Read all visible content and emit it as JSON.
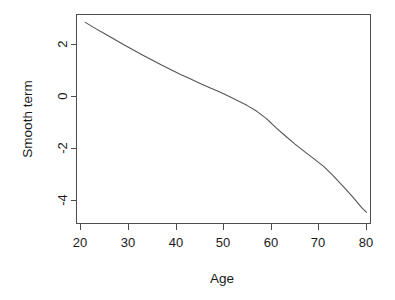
{
  "chart_data": {
    "type": "line",
    "title": "",
    "subtitle": "",
    "xlabel": "Age",
    "ylabel": "Smooth term",
    "xlim": [
      19.0,
      80.9
    ],
    "ylim": [
      -4.95,
      3.13
    ],
    "xticks": [
      20,
      30,
      40,
      50,
      60,
      70,
      80
    ],
    "xtick_labels": [
      "20",
      "30",
      "40",
      "50",
      "60",
      "70",
      "80"
    ],
    "yticks": [
      2,
      0,
      -2,
      -4
    ],
    "ytick_labels": [
      "2",
      "0",
      "-2",
      "-4"
    ],
    "grid": false,
    "legend": false,
    "legend_position": "none",
    "line_color": "#555555",
    "frame_color": "#4d4d4d",
    "background_color": "#ffffff",
    "y_axis_label_rotation": 90,
    "series": [
      {
        "name": "Smooth term",
        "x": [
          21.0,
          23.0,
          25.0,
          27.0,
          29.0,
          31.0,
          33.0,
          35.0,
          37.0,
          39.0,
          41.0,
          43.0,
          45.0,
          47.0,
          49.0,
          51.0,
          53.0,
          55.0,
          57.0,
          59.0,
          60.0,
          61.0,
          63.0,
          65.0,
          67.0,
          69.0,
          71.0,
          73.0,
          75.0,
          77.0,
          79.0,
          80.0
        ],
        "y": [
          2.85,
          2.63,
          2.42,
          2.21,
          2.0,
          1.8,
          1.6,
          1.4,
          1.21,
          1.03,
          0.85,
          0.68,
          0.51,
          0.35,
          0.19,
          0.02,
          -0.16,
          -0.35,
          -0.57,
          -0.85,
          -1.02,
          -1.2,
          -1.52,
          -1.83,
          -2.12,
          -2.4,
          -2.69,
          -3.04,
          -3.44,
          -3.84,
          -4.27,
          -4.46
        ]
      }
    ]
  },
  "axes": {
    "x_title": "Age",
    "y_title": "Smooth term"
  },
  "x_tick_labels": [
    "20",
    "30",
    "40",
    "50",
    "60",
    "70",
    "80"
  ],
  "y_tick_labels": [
    "2",
    "0",
    "-2",
    "-4"
  ]
}
